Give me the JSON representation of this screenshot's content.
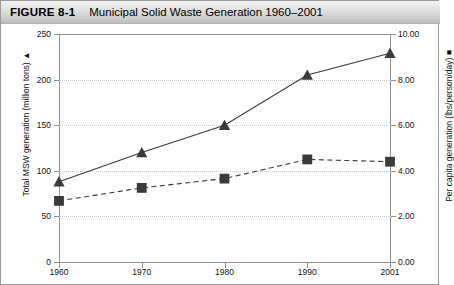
{
  "figure": {
    "number_label": "FIGURE 8-1",
    "title": "Municipal Solid Waste Generation 1960–2001"
  },
  "axes": {
    "left": {
      "title": "Total MSW generation (million tons)  ▲",
      "ticks": [
        "0",
        "50",
        "100",
        "150",
        "200",
        "250"
      ],
      "min": 0,
      "max": 250,
      "step": 50
    },
    "right": {
      "title": "Per capita generation (lbs/person/day)  ■",
      "ticks": [
        "0.00",
        "2.00",
        "4.00",
        "6.00",
        "8.00",
        "10.00"
      ],
      "min": 0,
      "max": 10,
      "step": 2
    },
    "x": {
      "ticks": [
        "1960",
        "1970",
        "1980",
        "1990",
        "2001"
      ]
    }
  },
  "chart_data": {
    "type": "line",
    "title": "Municipal Solid Waste Generation 1960–2001",
    "xlabel": "",
    "ylabel": "Total MSW generation (million tons)",
    "y2label": "Per capita generation (lbs/person/day)",
    "categories": [
      "1960",
      "1970",
      "1980",
      "1990",
      "2001"
    ],
    "ylim": [
      0,
      250
    ],
    "y2lim": [
      0,
      10
    ],
    "grid": true,
    "legend": "axis-titles-with-markers",
    "series": [
      {
        "name": "Total MSW generation (million tons)",
        "axis": "left",
        "marker": "triangle",
        "linestyle": "solid",
        "color": "#3a3a3a",
        "values": [
          88,
          120,
          150,
          205,
          229
        ]
      },
      {
        "name": "Per capita generation (lbs/person/day)",
        "axis": "right",
        "marker": "square",
        "linestyle": "dashed",
        "color": "#3a3a3a",
        "values": [
          2.68,
          3.25,
          3.66,
          4.5,
          4.4
        ]
      }
    ]
  },
  "colors": {
    "series": "#3a3a3a",
    "axis": "#8f8f8f",
    "grid": "#c9c9c9",
    "titlebar": "#d8d8d8"
  }
}
